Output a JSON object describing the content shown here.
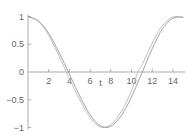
{
  "chart_data": {
    "type": "line",
    "title": "",
    "xlabel": "t",
    "ylabel": "",
    "xlim": [
      0,
      15
    ],
    "ylim": [
      -1,
      1
    ],
    "x_ticks": [
      "2",
      "4",
      "6",
      "8",
      "10",
      "12",
      "14"
    ],
    "y_ticks": [
      "1",
      "0.5",
      "0",
      "−0.5",
      "−1"
    ],
    "origin_label": "0",
    "grid": false,
    "legend": null,
    "series": [
      {
        "name": "curve-1",
        "color": "#b8b8b8",
        "x": [
          0,
          1,
          2,
          3,
          3.7,
          4,
          5,
          6,
          7,
          8,
          9,
          10,
          10.6,
          11,
          12,
          13,
          14,
          15
        ],
        "y": [
          1,
          0.91,
          0.66,
          0.29,
          0,
          -0.12,
          -0.5,
          -0.82,
          -0.99,
          -0.95,
          -0.72,
          -0.34,
          0,
          0.12,
          0.52,
          0.84,
          0.99,
          0.98
        ]
      },
      {
        "name": "curve-2",
        "color": "#9a9a9a",
        "x": [
          0,
          1,
          2,
          3,
          3.9,
          4,
          5,
          6,
          7,
          8,
          9,
          10,
          11,
          12,
          13,
          14,
          15
        ],
        "y": [
          1,
          0.92,
          0.7,
          0.35,
          0,
          -0.04,
          -0.43,
          -0.77,
          -0.97,
          -0.98,
          -0.79,
          -0.45,
          -0.02,
          0.42,
          0.78,
          0.97,
          0.99
        ]
      }
    ]
  }
}
